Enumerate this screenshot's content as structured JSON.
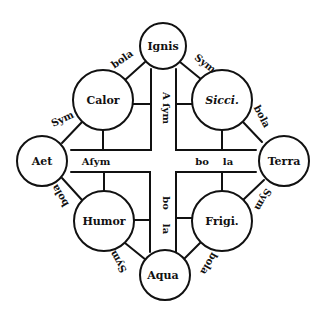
{
  "diagram": {
    "type": "elements-qualities-square",
    "colors": {
      "ink": "#111111",
      "paper": "#ffffff"
    },
    "nodes": [
      {
        "id": "ignis",
        "label": "Ignis",
        "kind": "element",
        "cx": 163,
        "cy": 46,
        "r": 23
      },
      {
        "id": "calor",
        "label": "Calor",
        "kind": "quality",
        "cx": 103,
        "cy": 100,
        "r": 30
      },
      {
        "id": "sicci",
        "label": "Sicci.",
        "kind": "quality",
        "cx": 222,
        "cy": 100,
        "r": 30
      },
      {
        "id": "aer",
        "label": "Aet",
        "kind": "element",
        "cx": 42,
        "cy": 161,
        "r": 25
      },
      {
        "id": "terra",
        "label": "Terra",
        "kind": "element",
        "cx": 284,
        "cy": 161,
        "r": 25
      },
      {
        "id": "humor",
        "label": "Humor",
        "kind": "quality",
        "cx": 104,
        "cy": 221,
        "r": 30
      },
      {
        "id": "frigi",
        "label": "Frigi.",
        "kind": "quality",
        "cx": 222,
        "cy": 221,
        "r": 30
      },
      {
        "id": "aqua",
        "label": "Aqua",
        "kind": "element",
        "cx": 165,
        "cy": 275,
        "r": 25
      }
    ],
    "edge_labels": [
      {
        "id": "ignis-calor",
        "text": "bola",
        "x": 124,
        "y": 62,
        "rotate": -35
      },
      {
        "id": "ignis-sicci",
        "text": "Sym",
        "x": 203,
        "y": 66,
        "rotate": 38
      },
      {
        "id": "calor-aer",
        "text": "Sym",
        "x": 62,
        "y": 122,
        "rotate": -25
      },
      {
        "id": "sicci-terra",
        "text": "bola",
        "x": 257,
        "y": 118,
        "rotate": 60
      },
      {
        "id": "aer-humor",
        "text": "bola",
        "x": 63,
        "y": 196,
        "rotate": 240
      },
      {
        "id": "terra-frigi",
        "text": "Sym",
        "x": 258,
        "y": 200,
        "rotate": 120
      },
      {
        "id": "humor-aqua",
        "text": "Sym",
        "x": 122,
        "y": 260,
        "rotate": 240
      },
      {
        "id": "frigi-aqua",
        "text": "bola",
        "x": 206,
        "y": 262,
        "rotate": 120
      }
    ],
    "cross_labels": {
      "vertical_top": "A ſym",
      "horizontal_left": "Aſym",
      "horizontal_right": [
        "bo",
        "la"
      ],
      "vertical_bottom": [
        "bo",
        "la"
      ]
    }
  }
}
